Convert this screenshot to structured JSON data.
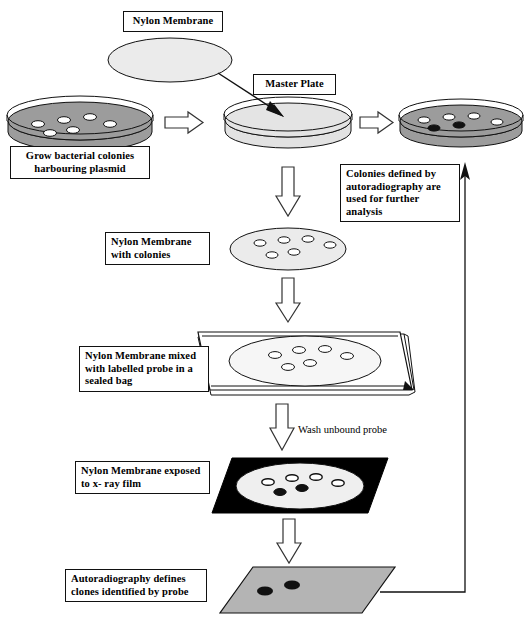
{
  "diagram": {
    "colors": {
      "agar_gray": "#9c9c9c",
      "plate_light": "#e2e2e2",
      "membrane_light": "#ebebeb",
      "film_black": "#000000",
      "autorad_gray": "#b4b4b4",
      "colony_white": "#ffffff",
      "colony_black": "#000000",
      "outline": "#111111"
    },
    "labels": {
      "nylon_membrane": "Nylon Membrane",
      "master_plate": "Master Plate",
      "grow_colonies": "Grow bacterial colonies\nharbouring plasmid",
      "colonies_defined": "Colonies defined by\n autoradiography are\nused for further analysis",
      "membrane_with_colonies": "Nylon Membrane\nwith colonies",
      "membrane_probe_bag": "Nylon Membrane mixed\nwith labelled probe in a\nsealed bag",
      "wash_unbound_probe": "Wash unbound probe",
      "membrane_xray": "Nylon Membrane exposed\nto x- ray film",
      "autoradiography_defines": "Autoradiography defines\nclones identified by probe"
    },
    "stages": [
      {
        "id": "master-plate-colonies",
        "name": "Grow bacterial colonies harbouring plasmid",
        "shape": "petri-dish",
        "fill": "agar_gray",
        "colonies": [
          {
            "x": 36,
            "y": 22,
            "type": "white"
          },
          {
            "x": 62,
            "y": 18,
            "type": "white"
          },
          {
            "x": 88,
            "y": 16,
            "type": "white"
          },
          {
            "x": 48,
            "y": 33,
            "type": "white"
          },
          {
            "x": 70,
            "y": 30,
            "type": "white"
          },
          {
            "x": 105,
            "y": 27,
            "type": "white"
          }
        ]
      },
      {
        "id": "master-plate",
        "name": "Master Plate",
        "shape": "petri-dish",
        "fill": "plate_light",
        "colonies": []
      },
      {
        "id": "replica-plate",
        "name": "Colonies defined by autoradiography",
        "shape": "petri-dish",
        "fill": "agar_gray",
        "colonies": [
          {
            "x": 30,
            "y": 20,
            "type": "white"
          },
          {
            "x": 55,
            "y": 17,
            "type": "white"
          },
          {
            "x": 80,
            "y": 16,
            "type": "white"
          },
          {
            "x": 100,
            "y": 23,
            "type": "white"
          },
          {
            "x": 38,
            "y": 30,
            "type": "black"
          },
          {
            "x": 62,
            "y": 28,
            "type": "black"
          }
        ]
      },
      {
        "id": "membrane-blank",
        "name": "Nylon Membrane",
        "shape": "ellipse",
        "fill": "membrane_light",
        "colonies": []
      },
      {
        "id": "membrane-with-colonies",
        "name": "Nylon Membrane with colonies",
        "shape": "ellipse",
        "fill": "membrane_light",
        "colonies": [
          {
            "x": -28,
            "y": -6,
            "type": "white"
          },
          {
            "x": -4,
            "y": -9,
            "type": "white"
          },
          {
            "x": 20,
            "y": -10,
            "type": "white"
          },
          {
            "x": 42,
            "y": -4,
            "type": "white"
          },
          {
            "x": -16,
            "y": 6,
            "type": "white"
          },
          {
            "x": 6,
            "y": 3,
            "type": "white"
          }
        ]
      },
      {
        "id": "sealed-bag",
        "name": "Nylon Membrane mixed with labelled probe in a sealed bag",
        "shape": "bag-parallelogram",
        "fill": "colony_white",
        "colonies": [
          {
            "x": -30,
            "y": -6,
            "type": "white"
          },
          {
            "x": -6,
            "y": -11,
            "type": "white"
          },
          {
            "x": 20,
            "y": -12,
            "type": "white"
          },
          {
            "x": 42,
            "y": -5,
            "type": "white"
          },
          {
            "x": -17,
            "y": 6,
            "type": "white"
          },
          {
            "x": 5,
            "y": 2,
            "type": "white"
          }
        ]
      },
      {
        "id": "xray-film",
        "name": "Nylon Membrane exposed to x- ray film",
        "shape": "parallelogram",
        "fill": "film_black",
        "colonies": [
          {
            "x": -32,
            "y": -4,
            "type": "white"
          },
          {
            "x": -8,
            "y": -8,
            "type": "white"
          },
          {
            "x": 16,
            "y": -9,
            "type": "white"
          },
          {
            "x": 38,
            "y": -3,
            "type": "white"
          },
          {
            "x": -20,
            "y": 6,
            "type": "black"
          },
          {
            "x": 2,
            "y": 2,
            "type": "black"
          }
        ]
      },
      {
        "id": "autoradiograph",
        "name": "Autoradiography defines clones identified by probe",
        "shape": "parallelogram",
        "fill": "autorad_gray",
        "colonies": [
          {
            "x": -22,
            "y": 4,
            "type": "black"
          },
          {
            "x": 2,
            "y": 0,
            "type": "black"
          }
        ]
      }
    ],
    "arrows": [
      {
        "id": "arrow-plate1-to-master",
        "type": "block-right"
      },
      {
        "id": "arrow-master-to-replica",
        "type": "block-right"
      },
      {
        "id": "arrow-membrane-to-master",
        "type": "thin-diagonal"
      },
      {
        "id": "arrow-master-down",
        "type": "block-down"
      },
      {
        "id": "arrow-membrane-down",
        "type": "block-down"
      },
      {
        "id": "arrow-bag-down",
        "type": "block-down"
      },
      {
        "id": "arrow-wash-down",
        "type": "block-down"
      },
      {
        "id": "arrow-film-down",
        "type": "block-down"
      },
      {
        "id": "arrow-feedback-up",
        "type": "thin-line-up"
      }
    ]
  }
}
